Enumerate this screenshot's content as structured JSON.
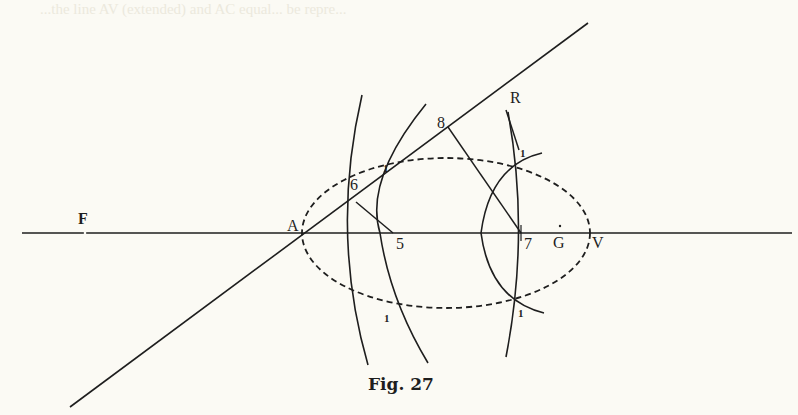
{
  "figure": {
    "caption": "Fig. 27",
    "colors": {
      "ink": "#1e1e1e",
      "paper": "#fbfaf4"
    }
  },
  "labels": {
    "F": "F",
    "A": "A",
    "five": "5",
    "six": "6",
    "seven": "7",
    "eight": "8",
    "R": "R",
    "G": "G",
    "V": "V",
    "arc_mark_top_left": "1",
    "arc_mark_bottom_left": "1",
    "arc_mark_top_right": "1",
    "arc_mark_bottom_right": "1"
  },
  "bleed_through_text": "...the line AV (extended) and AC equal... be repre..."
}
